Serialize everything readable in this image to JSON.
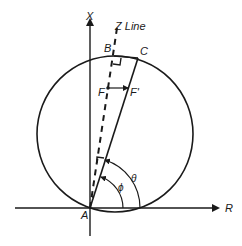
{
  "diagram": {
    "axes": {
      "vertical_label": "X",
      "horizontal_label": "R"
    },
    "line_label": "Z Line",
    "points": {
      "A": "A",
      "B": "B",
      "C": "C",
      "F": "F",
      "F_prime": "F'"
    },
    "angles": {
      "theta": "θ",
      "phi": "ϕ"
    },
    "colors": {
      "stroke": "#1a1a1a",
      "background": "#ffffff"
    }
  }
}
